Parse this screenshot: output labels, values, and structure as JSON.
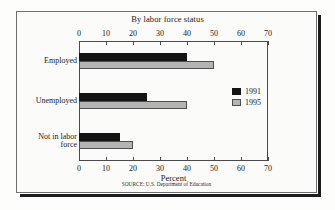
{
  "figure": {
    "title": "By labor force status",
    "source_note": "SOURCE: U.S. Department of Education"
  },
  "legend": {
    "entries": [
      {
        "label": "1991",
        "color": "#141414"
      },
      {
        "label": "1995",
        "color": "#b4b4b4"
      }
    ]
  },
  "axis": {
    "x_label": "Percent",
    "ticks": [
      "0",
      "10",
      "20",
      "30",
      "40",
      "50",
      "60",
      "70"
    ]
  },
  "categories": [
    {
      "line1": "Employed",
      "line2": ""
    },
    {
      "line1": "Unemployed",
      "line2": ""
    },
    {
      "line1": "Not in labor",
      "line2": "force"
    }
  ],
  "chart_data": {
    "type": "bar",
    "orientation": "horizontal",
    "title": "By labor force status",
    "xlabel": "Percent",
    "ylabel": "",
    "categories": [
      "Employed",
      "Unemployed",
      "Not in labor force"
    ],
    "series": [
      {
        "name": "1991",
        "color": "#141414",
        "values": [
          40,
          25,
          15
        ]
      },
      {
        "name": "1995",
        "color": "#b4b4b4",
        "values": [
          50,
          40,
          20
        ]
      }
    ],
    "xlim": [
      0,
      70
    ],
    "xticks": [
      0,
      10,
      20,
      30,
      40,
      50,
      60,
      70
    ],
    "grid": false,
    "legend_position": "right",
    "dual_axis": true,
    "annotations": [
      "SOURCE: U.S. Department of Education"
    ]
  }
}
